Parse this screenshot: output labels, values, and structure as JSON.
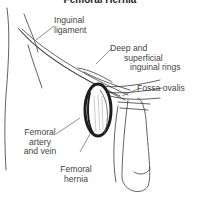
{
  "diagram": {
    "title": "Femoral Hernia",
    "labels": {
      "inguinal_ligament": [
        "Inguinal",
        "ligament"
      ],
      "rings": [
        "Deep and",
        "superficial",
        "inguinal rings"
      ],
      "fossa_ovalis": [
        "Fossa ovalis"
      ],
      "femoral_vessels": [
        "Femoral",
        "artery",
        "and vein"
      ],
      "femoral_hernia": [
        "Femoral",
        "hernia"
      ]
    },
    "colors": {
      "line": "#3a3a3a",
      "shade": "#1e1e1e",
      "text": "#444444",
      "background": "#ffffff"
    }
  }
}
